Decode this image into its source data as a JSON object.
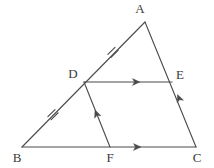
{
  "figure": {
    "type": "geometry-diagram",
    "background_color": "#ffffff",
    "stroke_color": "#4a4a4a",
    "label_color": "#3a3a3a"
  },
  "points": {
    "A": {
      "label": "A",
      "x": 145,
      "y": 22,
      "label_x": 140,
      "label_y": 13
    },
    "B": {
      "label": "B",
      "x": 22,
      "y": 147,
      "label_x": 17,
      "label_y": 162
    },
    "C": {
      "label": "C",
      "x": 196,
      "y": 147,
      "label_x": 197,
      "label_y": 162
    },
    "D": {
      "label": "D",
      "x": 84,
      "y": 82,
      "label_x": 73,
      "label_y": 78
    },
    "E": {
      "label": "E",
      "x": 172,
      "y": 82,
      "label_x": 180,
      "label_y": 79
    },
    "F": {
      "label": "F",
      "x": 110,
      "y": 147,
      "label_x": 110,
      "label_y": 162
    }
  },
  "segments": [
    {
      "name": "side-AB",
      "from": "A",
      "to": "B",
      "x1": 145,
      "y1": 22,
      "x2": 22,
      "y2": 147
    },
    {
      "name": "side-AC",
      "from": "A",
      "to": "C",
      "x1": 145,
      "y1": 22,
      "x2": 196,
      "y2": 147
    },
    {
      "name": "side-BC",
      "from": "B",
      "to": "C",
      "x1": 22,
      "y1": 147,
      "x2": 196,
      "y2": 147
    },
    {
      "name": "segment-DE",
      "from": "D",
      "to": "E",
      "x1": 84,
      "y1": 82,
      "x2": 172,
      "y2": 82
    },
    {
      "name": "segment-DF",
      "from": "D",
      "to": "F",
      "x1": 84,
      "y1": 82,
      "x2": 110,
      "y2": 147
    }
  ],
  "tick_marks": [
    {
      "name": "tick-AD",
      "count": 2,
      "x": 113,
      "y": 52.4,
      "angle_deg": 45.5
    },
    {
      "name": "tick-BD",
      "count": 2,
      "x": 53,
      "y": 114.7,
      "angle_deg": 45.5
    }
  ],
  "arrow_marks": [
    {
      "name": "arrow-DE",
      "on": "segment-DE",
      "x": 140,
      "y": 82,
      "angle_deg": 0
    },
    {
      "name": "arrow-FC",
      "on": "side-BC",
      "x": 140,
      "y": 147,
      "angle_deg": 0
    },
    {
      "name": "arrow-DF",
      "on": "segment-DF",
      "x": 95,
      "y": 110,
      "angle_deg": 248.2
    },
    {
      "name": "arrow-EC",
      "on": "side-AC",
      "x": 177,
      "y": 95,
      "angle_deg": 247.8
    }
  ]
}
